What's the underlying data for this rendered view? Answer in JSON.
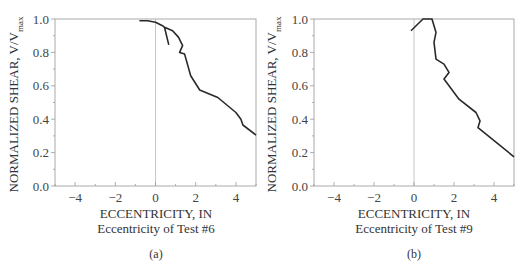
{
  "chart_data": [
    {
      "type": "line",
      "panel_label": "(a)",
      "title": "",
      "xlabel": "ECCENTRICITY, IN",
      "xsublabel": "Eccentricity of Test #6",
      "ylabel": "NORMALIZED SHEAR, V/V",
      "ylabel_subscript": "max",
      "xlim": [
        -5,
        5
      ],
      "ylim": [
        0.0,
        1.0
      ],
      "xticks": [
        "-4",
        "-2",
        "0",
        "2",
        "4"
      ],
      "yticks": [
        "0.0",
        "0.2",
        "0.4",
        "0.6",
        "0.8",
        "1.0"
      ],
      "grid": false,
      "reference_line_x": 0,
      "series": [
        {
          "name": "Test #6",
          "x": [
            -0.8,
            -0.4,
            0.0,
            0.35,
            0.45,
            0.65,
            0.45,
            0.85,
            1.15,
            1.35,
            1.2,
            1.45,
            1.75,
            2.2,
            3.1,
            4.0,
            4.25,
            4.35,
            5.0
          ],
          "y": [
            0.99,
            0.99,
            0.98,
            0.96,
            0.95,
            0.85,
            0.95,
            0.93,
            0.89,
            0.84,
            0.8,
            0.79,
            0.66,
            0.575,
            0.53,
            0.44,
            0.4,
            0.365,
            0.305
          ]
        }
      ]
    },
    {
      "type": "line",
      "panel_label": "(b)",
      "title": "",
      "xlabel": "ECCENTRICITY, IN",
      "xsublabel": "Eccentricity of Test #9",
      "ylabel": "NORMALIZED SHEAR, V/V",
      "ylabel_subscript": "max",
      "xlim": [
        -5,
        5
      ],
      "ylim": [
        0.0,
        1.0
      ],
      "xticks": [
        "-4",
        "-2",
        "0",
        "2",
        "4"
      ],
      "yticks": [
        "0.0",
        "0.2",
        "0.4",
        "0.6",
        "0.8",
        "1.0"
      ],
      "grid": false,
      "reference_line_x": 0,
      "series": [
        {
          "name": "Test #9",
          "x": [
            -0.15,
            0.45,
            0.9,
            1.1,
            1.0,
            1.1,
            1.5,
            1.65,
            1.75,
            1.5,
            2.25,
            3.1,
            3.3,
            3.2,
            5.0
          ],
          "y": [
            0.93,
            1.0,
            1.0,
            0.92,
            0.86,
            0.76,
            0.73,
            0.7,
            0.68,
            0.64,
            0.52,
            0.44,
            0.39,
            0.35,
            0.175
          ]
        }
      ]
    }
  ]
}
